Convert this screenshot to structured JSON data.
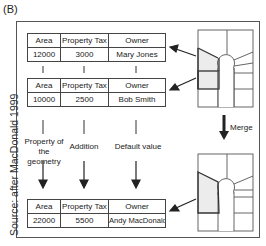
{
  "panel_label": "(B)",
  "source": "Source: after MacDonald 1999",
  "tables": [
    {
      "name": "parcel-a",
      "headers": [
        "Area",
        "Property Tax",
        "Owner"
      ],
      "values": [
        "12000",
        "3000",
        "Mary Jones"
      ]
    },
    {
      "name": "parcel-b",
      "headers": [
        "Area",
        "Property Tax",
        "Owner"
      ],
      "values": [
        "10000",
        "2500",
        "Bob Smith"
      ]
    },
    {
      "name": "merged-parcel",
      "headers": [
        "Area",
        "Property Tax",
        "Owner"
      ],
      "values": [
        "22000",
        "5500",
        "Andy MacDonald"
      ]
    }
  ],
  "operations": {
    "area": "Property of the geometry",
    "area_line1": "Property of",
    "area_line2": "the geometry",
    "tax": "Addition",
    "owner": "Default value"
  },
  "merge_label": "Merge",
  "colors": {
    "line": "#444444",
    "shade": "#ececec",
    "frame": "#555555"
  }
}
